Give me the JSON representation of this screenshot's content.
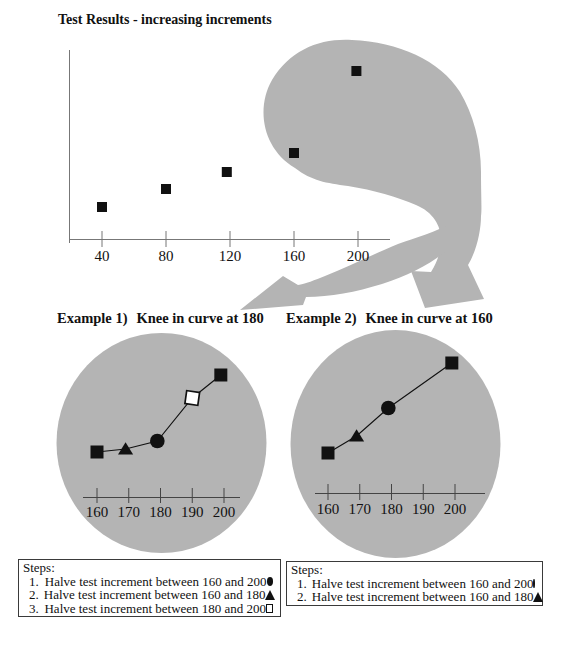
{
  "page": {
    "title": "Test Results - increasing increments"
  },
  "examples": [
    {
      "prefix": "Example 1)",
      "title": "Knee in curve at 180"
    },
    {
      "prefix": "Example 2)",
      "title": "Knee in curve at 160"
    }
  ],
  "chart_data": [
    {
      "id": "main",
      "type": "scatter",
      "title": "Test Results - increasing increments",
      "x": [
        40,
        80,
        118,
        160,
        199
      ],
      "y": [
        32,
        50,
        67,
        86,
        168
      ],
      "y_unit": "unlabeled-arbitrary",
      "marker": "square",
      "xticks": [
        40,
        80,
        120,
        160,
        200
      ],
      "xlabel": "",
      "ylabel": "",
      "grid": false
    },
    {
      "id": "example1",
      "type": "line",
      "title": "Knee in curve at 180",
      "x": [
        160,
        169,
        179,
        190,
        199
      ],
      "y": [
        45,
        48,
        56,
        99,
        122
      ],
      "y_unit": "unlabeled-arbitrary",
      "markers": [
        "square",
        "triangle",
        "circle",
        "open-square",
        "square"
      ],
      "xticks": [
        160,
        170,
        180,
        190,
        200
      ],
      "xlabel": "",
      "ylabel": "",
      "grid": false
    },
    {
      "id": "example2",
      "type": "line",
      "title": "Knee in curve at 160",
      "x": [
        160,
        169,
        179,
        199
      ],
      "y": [
        40,
        57,
        85,
        130
      ],
      "y_unit": "unlabeled-arbitrary",
      "markers": [
        "square",
        "triangle",
        "circle",
        "square"
      ],
      "xticks": [
        160,
        170,
        180,
        190,
        200
      ],
      "xlabel": "",
      "ylabel": "",
      "grid": false
    }
  ],
  "steps_left": {
    "heading": "Steps:",
    "items": [
      {
        "num": "1.",
        "text": "Halve test increment between 160 and 200",
        "marker": "circle"
      },
      {
        "num": "2.",
        "text": "Halve test increment between 160 and 180",
        "marker": "triangle"
      },
      {
        "num": "3.",
        "text": "Halve test increment between 180 and 200",
        "marker": "open-square"
      }
    ]
  },
  "steps_right": {
    "heading": "Steps:",
    "items": [
      {
        "num": "1.",
        "text": "Halve test increment between 160 and 200",
        "marker": "circle"
      },
      {
        "num": "2.",
        "text": "Halve test increment between 160 and 180",
        "marker": "triangle"
      }
    ]
  },
  "colors": {
    "blob": "#b4b4b4",
    "marker": "#111111",
    "main_axis": "#777777",
    "example_axis": "#444444",
    "text": "#111111"
  }
}
